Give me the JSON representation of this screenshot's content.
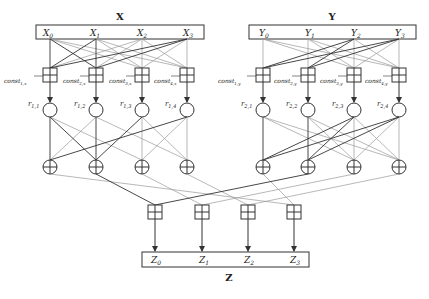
{
  "diagram": {
    "x_block": {
      "title": "X",
      "inputs": [
        "X",
        "X",
        "X",
        "X"
      ],
      "subs": [
        "0",
        "1",
        "2",
        "3"
      ]
    },
    "y_block": {
      "title": "Y",
      "inputs": [
        "Y",
        "Y",
        "Y",
        "Y"
      ],
      "subs": [
        "0",
        "1",
        "2",
        "3"
      ]
    },
    "z_block": {
      "title": "Z",
      "outputs": [
        "Z",
        "Z",
        "Z",
        "Z"
      ],
      "subs": [
        "0",
        "1",
        "2",
        "3"
      ]
    },
    "x_consts": [
      "const",
      "const",
      "const",
      "const"
    ],
    "x_const_subs": [
      "1,x",
      "2,x",
      "3,x",
      "4,x"
    ],
    "y_consts": [
      "const",
      "const",
      "const",
      "const"
    ],
    "y_const_subs": [
      "1,y",
      "2,y",
      "3,y",
      "4,y"
    ],
    "x_rounds": [
      "r",
      "r",
      "r",
      "r"
    ],
    "x_round_subs": [
      "1,1",
      "1,2",
      "1,3",
      "1,4"
    ],
    "y_rounds": [
      "r",
      "r",
      "r",
      "r"
    ],
    "y_round_subs": [
      "2,1",
      "2,2",
      "2,3",
      "2,4"
    ],
    "colors": {
      "dark_line": "#333333",
      "light_line": "#9a9a9a",
      "stroke": "#333333"
    }
  }
}
